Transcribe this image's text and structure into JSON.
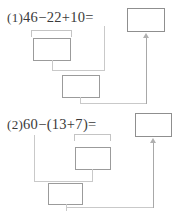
{
  "page": {
    "background_color": "#ffffff",
    "ink_color": "#3a3a3a",
    "box_border_color": "#9b9b9b",
    "connector_color": "#c9c9c9"
  },
  "problems": [
    {
      "number": "(1)",
      "expression": "46−22+10=",
      "equals_sign": "=",
      "answer_box_value": "",
      "steps": [
        {
          "label": "step-1-box",
          "value": ""
        },
        {
          "label": "step-2-box",
          "value": ""
        }
      ]
    },
    {
      "number": "(2)",
      "expression": "60−(13+7)=",
      "equals_sign": "=",
      "answer_box_value": "",
      "steps": [
        {
          "label": "step-1-box",
          "value": ""
        },
        {
          "label": "step-2-box",
          "value": ""
        }
      ]
    }
  ]
}
